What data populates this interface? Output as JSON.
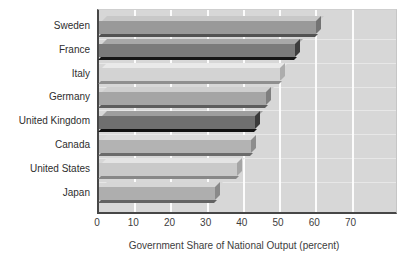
{
  "chart_data": {
    "type": "bar",
    "orientation": "horizontal",
    "title": "",
    "xlabel": "Government Share of National Output (percent)",
    "ylabel": "",
    "categories": [
      "Sweden",
      "France",
      "Italy",
      "Germany",
      "United Kingdom",
      "Canada",
      "United States",
      "Japan"
    ],
    "values": [
      60,
      54,
      50,
      46,
      43,
      42,
      38,
      32
    ],
    "xticks": [
      0,
      10,
      20,
      30,
      40,
      50,
      60,
      70
    ],
    "xlim": [
      0,
      82
    ],
    "grid": "vertical-white-gridlines",
    "legend": "none",
    "plot_bg": "#d7d7d7",
    "axis_color": "#474747",
    "bar_styles": [
      {
        "face": "#999999",
        "top": "#c8c8c8",
        "cap": "#737373",
        "shadow": "#525252"
      },
      {
        "face": "#7b7b7b",
        "top": "#a8a8a8",
        "cap": "#3d3d3d",
        "shadow": "#161616"
      },
      {
        "face": "#d3d3d3",
        "top": "#e9e9e9",
        "cap": "#adadad",
        "shadow": "#8f8f8f"
      },
      {
        "face": "#a5a5a5",
        "top": "#cfcfcf",
        "cap": "#7f7f7f",
        "shadow": "#5d5d5d"
      },
      {
        "face": "#6f6f6f",
        "top": "#9e9e9e",
        "cap": "#3a3a3a",
        "shadow": "#101010"
      },
      {
        "face": "#b3b3b3",
        "top": "#dadada",
        "cap": "#8d8d8d",
        "shadow": "#6b6b6b"
      },
      {
        "face": "#c9c9c9",
        "top": "#e4e4e4",
        "cap": "#a5a5a5",
        "shadow": "#878787"
      },
      {
        "face": "#aeaeae",
        "top": "#d6d6d6",
        "cap": "#898989",
        "shadow": "#636363"
      }
    ]
  }
}
